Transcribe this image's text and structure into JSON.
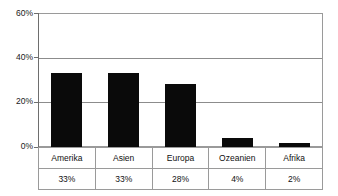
{
  "title": "",
  "chart_data": {
    "type": "bar",
    "title": "",
    "subtitle": "",
    "xlabel": "",
    "ylabel": "",
    "categories": [
      "Amerika",
      "Asien",
      "Europa",
      "Ozeanien",
      "Afrika"
    ],
    "values": [
      33,
      33,
      28,
      4,
      2
    ],
    "value_labels": [
      "33%",
      "33%",
      "28%",
      "4%",
      "2%"
    ],
    "ylim": [
      0,
      60
    ],
    "y_ticks": [
      0,
      20,
      40,
      60
    ],
    "y_tick_labels": [
      "0%",
      "20%",
      "40%",
      "60%"
    ],
    "grid": true,
    "grid_axis": "y",
    "legend": false,
    "legend_position": "none",
    "bar_color": "#0a0a0a",
    "gridline_color": "#8c8c8c",
    "axis_color": "#6e6e6e",
    "plot_border_color": "#9a9a9a",
    "background_color": "#ffffff",
    "has_data_table": true
  },
  "table": {
    "row_categories": [
      "Amerika",
      "Asien",
      "Europa",
      "Ozeanien",
      "Afrika"
    ],
    "row_values": [
      "33%",
      "33%",
      "28%",
      "4%",
      "2%"
    ]
  }
}
